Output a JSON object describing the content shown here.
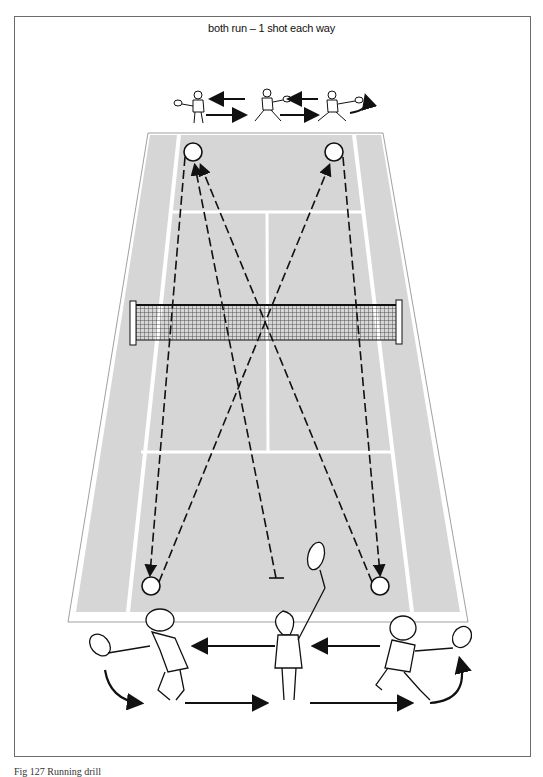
{
  "title": "both run – 1 shot each way",
  "caption": "Fig 127   Running drill",
  "colors": {
    "court": "#d8d8d8",
    "lines": "#ffffff",
    "ink": "#111111",
    "frame": "#6b6b6b"
  },
  "court": {
    "top_left": [
      148,
      133
    ],
    "top_right": [
      383,
      133
    ],
    "bottom_left": [
      68,
      622
    ],
    "bottom_right": [
      468,
      622
    ]
  },
  "net": {
    "left": 130,
    "right": 402,
    "top": 300,
    "bottom": 345
  },
  "balls": [
    {
      "id": "top-left-target",
      "cx": 193,
      "cy": 152
    },
    {
      "id": "top-right-target",
      "cx": 334,
      "cy": 152
    },
    {
      "id": "bottom-left-target",
      "cx": 151,
      "cy": 586
    },
    {
      "id": "bottom-right-target",
      "cx": 380,
      "cy": 586
    }
  ],
  "shots": [
    {
      "from": "top-left",
      "to": "bottom-left"
    },
    {
      "from": "bottom-left",
      "to": "top-right"
    },
    {
      "from": "top-right",
      "to": "bottom-right"
    },
    {
      "from": "bottom-right",
      "to": "top-left"
    },
    {
      "from": "center-feeder",
      "to": "top-left"
    }
  ],
  "players": {
    "top_row": [
      "top-left-player",
      "top-center-player",
      "top-right-player"
    ],
    "bottom_row": [
      "bottom-left-player",
      "bottom-center-feeder",
      "bottom-right-player"
    ]
  }
}
